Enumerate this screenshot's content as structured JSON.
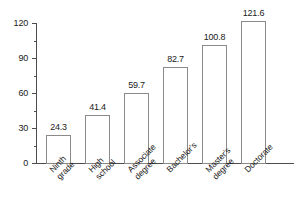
{
  "chart_data": {
    "type": "bar",
    "title": "",
    "xlabel": "",
    "ylabel": "",
    "ylim": [
      0,
      120
    ],
    "grid": false,
    "legend": false,
    "yticks": [
      0,
      30,
      60,
      90,
      120
    ],
    "ytick_labels": [
      "0",
      "30",
      "60",
      "90",
      "120"
    ],
    "minor_yticks": [
      15,
      45,
      75,
      105
    ],
    "categories": [
      "Ninth grade",
      "High school",
      "Associate degree",
      "Bachelor's",
      "Master's degree",
      "Doctorate"
    ],
    "category_lines": [
      [
        "Ninth",
        "grade"
      ],
      [
        "High",
        "school"
      ],
      [
        "Associate",
        "degree"
      ],
      [
        "Bachelor's"
      ],
      [
        "Master's",
        "degree"
      ],
      [
        "Doctorate"
      ]
    ],
    "values": [
      24.3,
      41.4,
      59.7,
      82.7,
      100.8,
      121.6
    ],
    "value_labels": [
      "24.3",
      "41.4",
      "59.7",
      "82.7",
      "100.8",
      "121.6"
    ],
    "colors": {
      "bar_fill": "#ffffff",
      "bar_border": "#8a8a8a",
      "axis": "#4d4d4d",
      "text": "#1a1a1a",
      "background": "#ffffff"
    }
  }
}
